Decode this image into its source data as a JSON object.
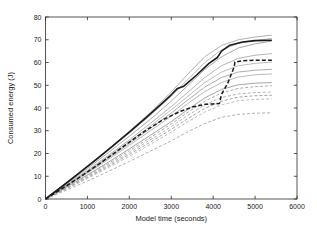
{
  "chart_data": {
    "type": "line",
    "title": "",
    "xlabel": "Model time (seconds)",
    "ylabel": "Consumed energy (J)",
    "xlim": [
      0,
      6000
    ],
    "ylim": [
      0,
      80
    ],
    "xticks": [
      0,
      1000,
      2000,
      3000,
      4000,
      5000,
      6000
    ],
    "yticks": [
      0,
      10,
      20,
      30,
      40,
      50,
      60,
      70,
      80
    ],
    "xtick_labels": [
      "0",
      "1000",
      "2000",
      "3000",
      "4000",
      "5000",
      "6000"
    ],
    "ytick_labels": [
      "0",
      "10",
      "20",
      "30",
      "40",
      "50",
      "60",
      "70",
      "80"
    ],
    "grid": false,
    "legend": "none",
    "colors": {
      "highlight_solid": "#1a1a1a",
      "highlight_dashed": "#1a1a1a",
      "background_light": "#b4b4b4",
      "background_mid": "#9a9a9a",
      "background_dark": "#808080",
      "axis": "#2b2b2b",
      "plot_background": "#ffffff"
    },
    "series": [
      {
        "name": "gray-solid-1",
        "style": "solid",
        "color": "#a8a8a8",
        "width": 0.9,
        "x": [
          0,
          500,
          1000,
          1500,
          2000,
          2500,
          3000,
          3400,
          3800,
          4200,
          4600,
          5000,
          5400
        ],
        "values": [
          0,
          7.2,
          14.6,
          22.0,
          29.8,
          38.0,
          47.0,
          55.0,
          62.5,
          67.5,
          70.0,
          71.2,
          72.0
        ]
      },
      {
        "name": "gray-solid-2",
        "style": "solid",
        "color": "#b0b0b0",
        "width": 0.9,
        "x": [
          0,
          500,
          1000,
          1500,
          2000,
          2500,
          3000,
          3400,
          3800,
          4200,
          4600,
          5000,
          5400
        ],
        "values": [
          0,
          7.0,
          14.2,
          21.4,
          29.0,
          36.8,
          45.2,
          52.6,
          60.0,
          65.6,
          68.4,
          69.6,
          70.6
        ]
      },
      {
        "name": "gray-solid-3",
        "style": "solid",
        "color": "#9e9e9e",
        "width": 0.9,
        "x": [
          0,
          500,
          1000,
          1500,
          2000,
          2500,
          3000,
          3400,
          3800,
          4200,
          4600,
          5000,
          5400
        ],
        "values": [
          0,
          6.6,
          13.4,
          20.4,
          27.6,
          35.0,
          43.0,
          50.0,
          57.0,
          62.5,
          66.4,
          68.2,
          69.4
        ]
      },
      {
        "name": "gray-solid-4",
        "style": "solid",
        "color": "#ababab",
        "width": 0.9,
        "x": [
          0,
          500,
          1000,
          1500,
          2000,
          2500,
          3000,
          3400,
          3800,
          4200,
          4600,
          5000,
          5400
        ],
        "values": [
          0,
          6.2,
          12.6,
          19.2,
          26.0,
          33.2,
          40.6,
          47.0,
          53.4,
          58.6,
          61.8,
          63.2,
          63.9
        ]
      },
      {
        "name": "gray-solid-5",
        "style": "solid",
        "color": "#b6b6b6",
        "width": 0.9,
        "x": [
          0,
          500,
          1000,
          1500,
          2000,
          2500,
          3000,
          3400,
          3800,
          4200,
          4600,
          5000,
          5400
        ],
        "values": [
          0,
          6.0,
          12.2,
          18.6,
          25.2,
          32.0,
          39.2,
          45.2,
          51.2,
          55.8,
          58.6,
          59.6,
          60.2
        ]
      },
      {
        "name": "gray-solid-6",
        "style": "solid",
        "color": "#a3a3a3",
        "width": 0.9,
        "x": [
          0,
          500,
          1000,
          1500,
          2000,
          2500,
          3000,
          3400,
          3800,
          4200,
          4600,
          5000,
          5400
        ],
        "values": [
          0,
          5.8,
          11.8,
          18.0,
          24.4,
          31.0,
          37.8,
          43.6,
          49.2,
          53.4,
          55.8,
          56.6,
          57.0
        ]
      },
      {
        "name": "gray-solid-7",
        "style": "solid",
        "color": "#b2b2b2",
        "width": 0.9,
        "x": [
          0,
          500,
          1000,
          1500,
          2000,
          2500,
          3000,
          3400,
          3800,
          4200,
          4600,
          5000,
          5400
        ],
        "values": [
          0,
          5.6,
          11.4,
          17.4,
          23.6,
          30.0,
          36.4,
          42.0,
          47.2,
          51.2,
          53.6,
          54.6,
          55.0
        ]
      },
      {
        "name": "gray-solid-8",
        "style": "solid",
        "color": "#9c9c9c",
        "width": 0.9,
        "x": [
          0,
          500,
          1000,
          1500,
          2000,
          2500,
          3000,
          3400,
          3800,
          4200,
          4600,
          5000,
          5400
        ],
        "values": [
          0,
          5.2,
          10.6,
          16.2,
          22.0,
          28.0,
          34.0,
          39.4,
          44.4,
          48.2,
          50.2,
          50.9,
          51.2
        ]
      },
      {
        "name": "black-solid-highlight",
        "style": "solid",
        "color": "#1a1a1a",
        "width": 1.6,
        "x": [
          0,
          400,
          800,
          1200,
          1600,
          2000,
          2400,
          2800,
          3000,
          3150,
          3300,
          3600,
          3900,
          4100,
          4200,
          4400,
          4700,
          5000,
          5400
        ],
        "values": [
          0,
          5.6,
          11.4,
          17.2,
          23.2,
          29.4,
          35.8,
          42.4,
          45.8,
          48.6,
          49.6,
          54.4,
          59.6,
          62.2,
          65.0,
          67.6,
          69.0,
          69.6,
          69.8
        ]
      },
      {
        "name": "gray-dashed-1",
        "style": "dashed",
        "color": "#a0a0a0",
        "width": 0.9,
        "x": [
          0,
          500,
          1000,
          1500,
          2000,
          2500,
          3000,
          3400,
          3800,
          4200,
          4600,
          5000,
          5400
        ],
        "values": [
          0,
          5.0,
          10.2,
          15.6,
          21.2,
          27.0,
          33.0,
          38.2,
          43.0,
          46.6,
          48.6,
          49.4,
          49.8
        ]
      },
      {
        "name": "gray-dashed-2",
        "style": "dashed",
        "color": "#aeaeae",
        "width": 0.9,
        "x": [
          0,
          500,
          1000,
          1500,
          2000,
          2500,
          3000,
          3400,
          3800,
          4200,
          4600,
          5000,
          5400
        ],
        "values": [
          0,
          4.8,
          9.8,
          15.0,
          20.4,
          26.0,
          31.8,
          36.8,
          41.4,
          44.6,
          46.2,
          46.8,
          47.0
        ]
      },
      {
        "name": "gray-dashed-3",
        "style": "dashed",
        "color": "#9a9a9a",
        "width": 0.9,
        "x": [
          0,
          500,
          1000,
          1500,
          2000,
          2500,
          3000,
          3400,
          3800,
          4200,
          4600,
          5000,
          5400
        ],
        "values": [
          0,
          4.6,
          9.4,
          14.4,
          19.6,
          25.0,
          30.6,
          35.4,
          39.8,
          43.0,
          44.8,
          45.4,
          45.6
        ]
      },
      {
        "name": "gray-dashed-4",
        "style": "dashed",
        "color": "#b4b4b4",
        "width": 0.9,
        "x": [
          0,
          500,
          1000,
          1500,
          2000,
          2500,
          3000,
          3400,
          3800,
          4200,
          4600,
          5000,
          5400
        ],
        "values": [
          0,
          4.4,
          9.0,
          13.8,
          18.8,
          24.0,
          29.4,
          34.0,
          38.2,
          41.4,
          43.2,
          43.8,
          44.0
        ]
      },
      {
        "name": "gray-dashed-5",
        "style": "dashed",
        "color": "#a6a6a6",
        "width": 0.9,
        "x": [
          0,
          500,
          1000,
          1500,
          2000,
          2500,
          3000,
          3400,
          3800,
          4200,
          4600,
          5000,
          5400
        ],
        "values": [
          0,
          3.9,
          7.9,
          12.1,
          16.5,
          21.0,
          25.6,
          29.6,
          33.2,
          35.9,
          37.2,
          37.7,
          37.9
        ]
      },
      {
        "name": "black-dashed-highlight",
        "style": "dashed",
        "color": "#1a1a1a",
        "width": 1.5,
        "x": [
          0,
          400,
          800,
          1200,
          1600,
          2000,
          2400,
          2800,
          3200,
          3500,
          3800,
          4000,
          4150,
          4200,
          4350,
          4500,
          4520,
          4700,
          5000,
          5400
        ],
        "values": [
          0,
          4.6,
          9.4,
          14.4,
          19.6,
          25.0,
          30.2,
          34.8,
          38.4,
          40.4,
          41.6,
          41.8,
          42.0,
          46.0,
          51.0,
          58.0,
          60.2,
          60.8,
          61.0,
          61.0
        ]
      }
    ]
  },
  "axes": {
    "x_title": "Model time (seconds)",
    "y_title": "Consumed energy (J)"
  }
}
